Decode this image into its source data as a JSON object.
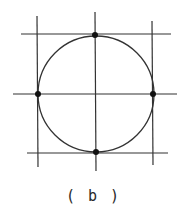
{
  "figure": {
    "caption": "( b )",
    "stroke_color": "#333333",
    "circle": {
      "cx": 96,
      "cy": 94,
      "r": 58
    },
    "lines": {
      "horizontal": [
        {
          "name": "top-tangent",
          "x1": 21,
          "y1": 34,
          "x2": 171,
          "y2": 34
        },
        {
          "name": "middle-axis",
          "x1": 13,
          "y1": 94,
          "x2": 177,
          "y2": 94
        },
        {
          "name": "bottom-tangent",
          "x1": 27,
          "y1": 153,
          "x2": 168,
          "y2": 153
        }
      ],
      "vertical": [
        {
          "name": "left-tangent",
          "x1": 37,
          "y1": 16,
          "x2": 38,
          "y2": 167
        },
        {
          "name": "center-axis",
          "x1": 95,
          "y1": 12,
          "x2": 96,
          "y2": 171
        },
        {
          "name": "right-tangent",
          "x1": 152,
          "y1": 21,
          "x2": 153,
          "y2": 165
        }
      ]
    },
    "points": [
      {
        "name": "top",
        "x": 95,
        "y": 35
      },
      {
        "name": "left",
        "x": 38,
        "y": 94
      },
      {
        "name": "right",
        "x": 153,
        "y": 94
      },
      {
        "name": "bottom",
        "x": 96,
        "y": 152
      }
    ]
  }
}
